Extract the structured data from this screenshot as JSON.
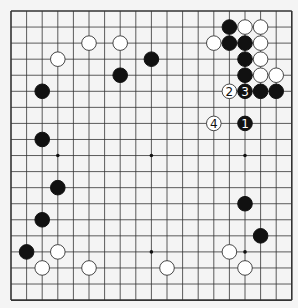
{
  "board": {
    "size": 19,
    "origin_x": 11,
    "origin_y": 11,
    "spacing_x": 15.6,
    "spacing_y": 16.06,
    "background": "#f4f4f4",
    "line_color": "#333333",
    "star_points": [
      [
        3,
        9
      ],
      [
        9,
        9
      ],
      [
        15,
        9
      ],
      [
        9,
        15
      ],
      [
        15,
        15
      ],
      [
        3,
        3
      ],
      [
        9,
        3
      ],
      [
        15,
        3
      ],
      [
        3,
        15
      ]
    ]
  },
  "stones": [
    {
      "color": "white",
      "col": 5,
      "row": 2
    },
    {
      "color": "white",
      "col": 7,
      "row": 2
    },
    {
      "color": "white",
      "col": 3,
      "row": 3
    },
    {
      "color": "black",
      "col": 9,
      "row": 3
    },
    {
      "color": "black",
      "col": 7,
      "row": 4
    },
    {
      "color": "black",
      "col": 2,
      "row": 5
    },
    {
      "color": "black",
      "col": 2,
      "row": 8
    },
    {
      "color": "black",
      "col": 14,
      "row": 1
    },
    {
      "color": "white",
      "col": 15,
      "row": 1
    },
    {
      "color": "white",
      "col": 16,
      "row": 1
    },
    {
      "color": "white",
      "col": 13,
      "row": 2
    },
    {
      "color": "black",
      "col": 14,
      "row": 2
    },
    {
      "color": "black",
      "col": 15,
      "row": 2
    },
    {
      "color": "white",
      "col": 16,
      "row": 2
    },
    {
      "color": "black",
      "col": 15,
      "row": 3
    },
    {
      "color": "white",
      "col": 16,
      "row": 3
    },
    {
      "color": "black",
      "col": 15,
      "row": 4
    },
    {
      "color": "white",
      "col": 16,
      "row": 4
    },
    {
      "color": "white",
      "col": 17,
      "row": 4
    },
    {
      "color": "white",
      "col": 14,
      "row": 5,
      "label": "2"
    },
    {
      "color": "black",
      "col": 15,
      "row": 5,
      "label": "3"
    },
    {
      "color": "black",
      "col": 16,
      "row": 5
    },
    {
      "color": "black",
      "col": 17,
      "row": 5
    },
    {
      "color": "white",
      "col": 13,
      "row": 7,
      "label": "4"
    },
    {
      "color": "black",
      "col": 15,
      "row": 7,
      "label": "1"
    },
    {
      "color": "black",
      "col": 3,
      "row": 11
    },
    {
      "color": "black",
      "col": 2,
      "row": 13
    },
    {
      "color": "black",
      "col": 1,
      "row": 15
    },
    {
      "color": "white",
      "col": 3,
      "row": 15
    },
    {
      "color": "white",
      "col": 2,
      "row": 16
    },
    {
      "color": "white",
      "col": 5,
      "row": 16
    },
    {
      "color": "black",
      "col": 15,
      "row": 12
    },
    {
      "color": "black",
      "col": 16,
      "row": 14
    },
    {
      "color": "white",
      "col": 14,
      "row": 15
    },
    {
      "color": "white",
      "col": 15,
      "row": 16
    },
    {
      "color": "white",
      "col": 10,
      "row": 16
    }
  ]
}
